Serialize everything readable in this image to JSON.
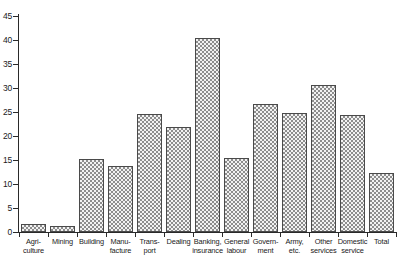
{
  "chart_data": {
    "type": "bar",
    "title": "",
    "subtitle": "",
    "xlabel": "",
    "ylabel": "",
    "ylim": [
      0,
      45
    ],
    "yticks": [
      0,
      5,
      10,
      15,
      20,
      25,
      30,
      35,
      40,
      45
    ],
    "grid": false,
    "legend": "none",
    "categories": [
      "Agriculture",
      "Mining",
      "Building",
      "Manufacture",
      "Transport",
      "Dealing",
      "Banking, insurance",
      "General labour",
      "Government",
      "Army, etc.",
      "Other services",
      "Domestic service",
      "Total"
    ],
    "category_lines": [
      [
        "Agri-",
        "culture"
      ],
      [
        "Mining",
        ""
      ],
      [
        "Building",
        ""
      ],
      [
        "Manu-",
        "facture"
      ],
      [
        "Trans-",
        "port"
      ],
      [
        "Dealing",
        ""
      ],
      [
        "Banking,",
        "insurance"
      ],
      [
        "General",
        "labour"
      ],
      [
        "Govern-",
        "ment"
      ],
      [
        "Army,",
        "etc."
      ],
      [
        "Other",
        "services"
      ],
      [
        "Domestic",
        "service"
      ],
      [
        "Total",
        ""
      ]
    ],
    "values": [
      1.6,
      1.3,
      15.2,
      13.8,
      24.6,
      21.8,
      40.5,
      15.4,
      26.6,
      24.8,
      30.7,
      24.3,
      12.3
    ],
    "colors": {
      "bar_fill": "#f2f2f2",
      "bar_hatch": "#8d8d8d",
      "bar_border": "#4a4a4a",
      "axis": "#2a2a2a",
      "text": "#1a1a1a",
      "background": "#ffffff"
    }
  }
}
